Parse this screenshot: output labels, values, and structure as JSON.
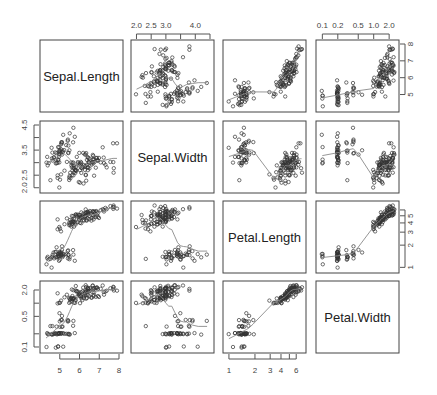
{
  "chart_data": {
    "type": "scatter",
    "subtype": "scatterplot_matrix",
    "title": "",
    "variables": [
      "Sepal.Length",
      "Sepal.Width",
      "Petal.Length",
      "Petal.Width"
    ],
    "scales": {
      "Sepal.Length": {
        "log": false,
        "range": [
          4.2,
          8.0
        ],
        "ticks": [
          "5",
          "6",
          "7",
          "8"
        ],
        "tick_values": [
          5,
          6,
          7,
          8
        ]
      },
      "Sepal.Width": {
        "log": false,
        "range": [
          1.95,
          4.5
        ],
        "ticks": [
          "2.0",
          "2.5",
          "3.0",
          "3.5",
          "4.0",
          "4.5"
        ],
        "tick_values": [
          2.0,
          2.5,
          3.0,
          3.5,
          4.0,
          4.5
        ]
      },
      "Petal.Length": {
        "log": true,
        "range": [
          0.95,
          7.0
        ],
        "ticks": [
          "1",
          "2",
          "3",
          "4",
          "5",
          "6"
        ],
        "tick_values": [
          1,
          2,
          3,
          4,
          5,
          6
        ]
      },
      "Petal.Width": {
        "log": true,
        "range": [
          0.09,
          2.6
        ],
        "ticks": [
          "0.1",
          "0.2",
          "0.5",
          "1.0",
          "2.0"
        ],
        "tick_values": [
          0.1,
          0.2,
          0.5,
          1.0,
          2.0
        ]
      }
    },
    "axis_labels_shown": {
      "top": [
        {
          "column": 1,
          "labels": [
            "2.0",
            "2.5",
            "3.0",
            "4.0"
          ]
        },
        {
          "column": 3,
          "labels": [
            "0.1",
            "0.2",
            "0.5",
            "1.0",
            "2.0"
          ]
        }
      ],
      "bottom": [
        {
          "column": 0,
          "labels": [
            "5",
            "6",
            "7",
            "8"
          ]
        },
        {
          "column": 2,
          "labels": [
            "1",
            "2",
            "3",
            "4",
            "6"
          ]
        }
      ],
      "left": [
        {
          "row": 1,
          "labels": [
            "2.0",
            "2.5",
            "3.5",
            "4.5"
          ]
        },
        {
          "row": 3,
          "labels": [
            "0.1",
            "0.5",
            "2.0"
          ]
        }
      ],
      "right": [
        {
          "row": 0,
          "labels": [
            "5",
            "6",
            "7",
            "8"
          ]
        },
        {
          "row": 2,
          "labels": [
            "1",
            "2",
            "3",
            "4",
            "5"
          ]
        }
      ]
    },
    "smoother": "lowess",
    "grid": false,
    "legend": "none",
    "n_points": 150,
    "points": {
      "Sepal.Length": [
        5.1,
        4.9,
        4.7,
        4.6,
        5.0,
        5.4,
        4.6,
        5.0,
        4.4,
        4.9,
        5.4,
        4.8,
        4.8,
        4.3,
        5.8,
        5.7,
        5.4,
        5.1,
        5.7,
        5.1,
        5.4,
        5.1,
        4.6,
        5.1,
        4.8,
        5.0,
        5.0,
        5.2,
        5.2,
        4.7,
        4.8,
        5.4,
        5.2,
        5.5,
        4.9,
        5.0,
        5.5,
        4.9,
        4.4,
        5.1,
        5.0,
        4.5,
        4.4,
        5.0,
        5.1,
        4.8,
        5.1,
        4.6,
        5.3,
        5.0,
        7.0,
        6.4,
        6.9,
        5.5,
        6.5,
        5.7,
        6.3,
        4.9,
        6.6,
        5.2,
        5.0,
        5.9,
        6.0,
        6.1,
        5.6,
        6.7,
        5.6,
        5.8,
        6.2,
        5.6,
        5.9,
        6.1,
        6.3,
        6.1,
        6.4,
        6.6,
        6.8,
        6.7,
        6.0,
        5.7,
        5.5,
        5.5,
        5.8,
        6.0,
        5.4,
        6.0,
        6.7,
        6.3,
        5.6,
        5.5,
        5.5,
        6.1,
        5.8,
        5.0,
        5.6,
        5.7,
        5.7,
        6.2,
        5.1,
        5.7,
        6.3,
        5.8,
        7.1,
        6.3,
        6.5,
        7.6,
        4.9,
        7.3,
        6.7,
        7.2,
        6.5,
        6.4,
        6.8,
        5.7,
        5.8,
        6.4,
        6.5,
        7.7,
        7.7,
        6.0,
        6.9,
        5.6,
        7.7,
        6.3,
        6.7,
        7.2,
        6.2,
        6.1,
        6.4,
        7.2,
        7.4,
        7.9,
        6.4,
        6.3,
        6.1,
        7.7,
        6.3,
        6.4,
        6.0,
        6.9,
        6.7,
        6.9,
        5.8,
        6.8,
        6.7,
        6.7,
        6.3,
        6.5,
        6.2,
        5.9
      ],
      "Sepal.Width": [
        3.5,
        3.0,
        3.2,
        3.1,
        3.6,
        3.9,
        3.4,
        3.4,
        2.9,
        3.1,
        3.7,
        3.4,
        3.0,
        3.0,
        4.0,
        4.4,
        3.9,
        3.5,
        3.8,
        3.8,
        3.4,
        3.7,
        3.6,
        3.3,
        3.4,
        3.0,
        3.4,
        3.5,
        3.4,
        3.2,
        3.1,
        3.4,
        4.1,
        4.2,
        3.1,
        3.2,
        3.5,
        3.6,
        3.0,
        3.4,
        3.5,
        2.3,
        3.2,
        3.5,
        3.8,
        3.0,
        3.8,
        3.2,
        3.7,
        3.3,
        3.2,
        3.2,
        3.1,
        2.3,
        2.8,
        2.8,
        3.3,
        2.4,
        2.9,
        2.7,
        2.0,
        3.0,
        2.2,
        2.9,
        2.9,
        3.1,
        3.0,
        2.7,
        2.2,
        2.5,
        3.2,
        2.8,
        2.5,
        2.8,
        2.9,
        3.0,
        2.8,
        3.0,
        2.9,
        2.6,
        2.4,
        2.4,
        2.7,
        2.7,
        3.0,
        3.4,
        3.1,
        2.3,
        3.0,
        2.5,
        2.6,
        3.0,
        2.6,
        2.3,
        2.7,
        3.0,
        2.9,
        2.9,
        2.5,
        2.8,
        3.3,
        2.7,
        3.0,
        2.9,
        3.0,
        3.0,
        2.5,
        2.9,
        2.5,
        3.6,
        3.2,
        2.7,
        3.0,
        2.5,
        2.8,
        3.2,
        3.0,
        3.8,
        2.6,
        2.2,
        3.2,
        2.8,
        2.8,
        2.7,
        3.3,
        3.2,
        2.8,
        3.0,
        2.8,
        3.0,
        2.8,
        3.8,
        2.8,
        2.8,
        2.6,
        3.0,
        3.4,
        3.1,
        3.0,
        3.1,
        3.1,
        3.1,
        2.7,
        3.2,
        3.3,
        3.0,
        2.5,
        3.0,
        3.4,
        3.0
      ],
      "Petal.Length": [
        1.4,
        1.4,
        1.3,
        1.5,
        1.4,
        1.7,
        1.4,
        1.5,
        1.4,
        1.5,
        1.5,
        1.6,
        1.4,
        1.1,
        1.2,
        1.5,
        1.3,
        1.4,
        1.7,
        1.5,
        1.7,
        1.5,
        1.0,
        1.7,
        1.9,
        1.6,
        1.6,
        1.5,
        1.4,
        1.6,
        1.6,
        1.5,
        1.5,
        1.4,
        1.5,
        1.2,
        1.3,
        1.4,
        1.3,
        1.5,
        1.3,
        1.3,
        1.3,
        1.6,
        1.9,
        1.4,
        1.6,
        1.4,
        1.5,
        1.4,
        4.7,
        4.5,
        4.9,
        4.0,
        4.6,
        4.5,
        4.7,
        3.3,
        4.6,
        3.9,
        3.5,
        4.2,
        4.0,
        4.7,
        3.6,
        4.4,
        4.5,
        4.1,
        4.5,
        3.9,
        4.8,
        4.0,
        4.9,
        4.7,
        4.3,
        4.4,
        4.8,
        5.0,
        4.5,
        3.5,
        3.8,
        3.7,
        3.9,
        5.1,
        4.5,
        4.5,
        4.7,
        4.4,
        4.1,
        4.0,
        4.4,
        4.6,
        4.0,
        3.3,
        4.2,
        4.2,
        4.2,
        4.3,
        3.0,
        4.1,
        6.0,
        5.1,
        5.9,
        5.6,
        5.8,
        6.6,
        4.5,
        6.3,
        5.8,
        6.1,
        5.1,
        5.3,
        5.5,
        5.0,
        5.1,
        5.3,
        5.5,
        6.7,
        6.9,
        5.0,
        5.7,
        4.9,
        6.7,
        4.9,
        5.7,
        6.0,
        4.8,
        4.9,
        5.6,
        5.8,
        6.1,
        6.4,
        5.6,
        5.1,
        5.6,
        6.1,
        5.6,
        5.5,
        4.8,
        5.4,
        5.6,
        5.1,
        5.1,
        5.9,
        5.7,
        5.2,
        5.0,
        5.2,
        5.4,
        5.1
      ],
      "Petal.Width": [
        0.2,
        0.2,
        0.2,
        0.2,
        0.2,
        0.4,
        0.3,
        0.2,
        0.2,
        0.1,
        0.2,
        0.2,
        0.1,
        0.1,
        0.2,
        0.4,
        0.4,
        0.3,
        0.3,
        0.3,
        0.2,
        0.4,
        0.2,
        0.5,
        0.2,
        0.2,
        0.4,
        0.2,
        0.2,
        0.2,
        0.2,
        0.4,
        0.1,
        0.2,
        0.2,
        0.2,
        0.2,
        0.1,
        0.2,
        0.2,
        0.3,
        0.3,
        0.2,
        0.6,
        0.4,
        0.3,
        0.2,
        0.2,
        0.2,
        0.2,
        1.4,
        1.5,
        1.5,
        1.3,
        1.5,
        1.3,
        1.6,
        1.0,
        1.3,
        1.4,
        1.0,
        1.5,
        1.0,
        1.4,
        1.3,
        1.4,
        1.5,
        1.0,
        1.5,
        1.1,
        1.8,
        1.3,
        1.5,
        1.2,
        1.3,
        1.4,
        1.4,
        1.7,
        1.5,
        1.0,
        1.1,
        1.0,
        1.2,
        1.6,
        1.5,
        1.6,
        1.5,
        1.3,
        1.3,
        1.3,
        1.2,
        1.4,
        1.2,
        1.0,
        1.3,
        1.2,
        1.3,
        1.3,
        1.1,
        1.3,
        2.5,
        1.9,
        2.1,
        1.8,
        2.2,
        2.1,
        1.7,
        1.8,
        1.8,
        2.5,
        2.0,
        1.9,
        2.1,
        2.0,
        2.4,
        2.3,
        1.8,
        2.2,
        2.3,
        1.5,
        2.3,
        2.0,
        2.0,
        1.8,
        2.1,
        1.8,
        1.8,
        1.8,
        2.1,
        1.6,
        1.9,
        2.0,
        2.2,
        1.5,
        1.4,
        2.3,
        2.4,
        1.8,
        1.8,
        2.1,
        2.4,
        2.3,
        1.9,
        2.3,
        2.5,
        2.3,
        1.9,
        2.0,
        2.3,
        1.8
      ]
    }
  }
}
